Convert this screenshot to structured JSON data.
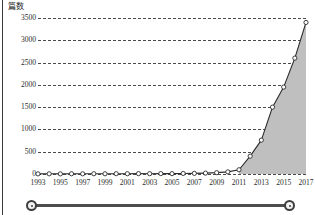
{
  "chart_data": {
    "type": "area",
    "title": "",
    "subtitle": "",
    "xlabel": "",
    "ylabel": "篇数",
    "ylim": [
      0,
      3500
    ],
    "xlim": [
      1993,
      2017
    ],
    "grid": true,
    "legend": null,
    "x": [
      1993,
      1994,
      1995,
      1996,
      1997,
      1998,
      1999,
      2000,
      2001,
      2002,
      2003,
      2004,
      2005,
      2006,
      2007,
      2008,
      2009,
      2010,
      2011,
      2012,
      2013,
      2014,
      2015,
      2016,
      2017
    ],
    "series": [
      {
        "name": "篇数",
        "values": [
          3,
          4,
          3,
          5,
          4,
          6,
          5,
          7,
          6,
          8,
          7,
          9,
          8,
          12,
          14,
          20,
          30,
          48,
          95,
          400,
          760,
          1500,
          1950,
          2600,
          3400
        ]
      }
    ],
    "xticks": [
      1993,
      1995,
      1997,
      1999,
      2001,
      2003,
      2005,
      2007,
      2009,
      2011,
      2013,
      2015,
      2017
    ],
    "xtick_labels": [
      "1993",
      "1995",
      "1997",
      "1999",
      "2001",
      "2003",
      "2005",
      "2007",
      "2009",
      "2011",
      "2013",
      "2015",
      "2017"
    ],
    "yticks": [
      0,
      500,
      1000,
      1500,
      2000,
      2500,
      3000,
      3500
    ],
    "ytick_labels": [
      "0",
      "500",
      "1000",
      "1500",
      "2000",
      "2500",
      "3000",
      "3500"
    ],
    "colors": {
      "line": "#2b2b2b",
      "marker_fill": "#ffffff",
      "marker_stroke": "#2b2b2b",
      "area_fill": "#bfbfbf",
      "gridline": "#4a4a4a",
      "text": "#2b2b2b"
    }
  },
  "scrollbar": {
    "left_handle_label": "range-start-handle",
    "right_handle_label": "range-end-handle"
  }
}
